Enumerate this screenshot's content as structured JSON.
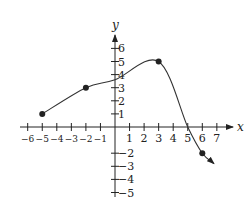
{
  "chart_data": {
    "type": "line",
    "title": "",
    "xlabel": "x",
    "ylabel": "y",
    "xlim": [
      -6,
      7
    ],
    "ylim": [
      -5,
      6
    ],
    "grid": false,
    "x_ticks": [
      -6,
      -5,
      -4,
      -3,
      -2,
      -1,
      1,
      2,
      3,
      4,
      5,
      6,
      7
    ],
    "x_tick_labels": [
      "−6",
      "−5",
      "−4",
      "−3",
      "−2",
      "−1",
      "1",
      "2",
      "3",
      "4",
      "5",
      "6",
      "7"
    ],
    "y_ticks": [
      -5,
      -4,
      -3,
      -2,
      1,
      2,
      3,
      4,
      5,
      6
    ],
    "y_tick_labels": [
      "−5",
      "−4",
      "−3",
      "−2",
      "1",
      "2",
      "3",
      "4",
      "5",
      "6"
    ],
    "series": [
      {
        "name": "f(x)",
        "marked_points": [
          {
            "x": -5,
            "y": 1
          },
          {
            "x": -2,
            "y": 3
          },
          {
            "x": 3,
            "y": 5
          },
          {
            "x": 6,
            "y": -2
          }
        ],
        "curve_points": [
          {
            "x": -5,
            "y": 1
          },
          {
            "x": -2,
            "y": 3
          },
          {
            "x": 0,
            "y": 3.6
          },
          {
            "x": 3,
            "y": 5
          },
          {
            "x": 5,
            "y": 0
          },
          {
            "x": 6,
            "y": -2
          },
          {
            "x": 6.8,
            "y": -2.8
          }
        ],
        "right_end_arrow": true,
        "x_intercept": 5
      }
    ],
    "colors": {
      "axis": "#222222",
      "curve": "#333333",
      "points": "#222222"
    }
  }
}
